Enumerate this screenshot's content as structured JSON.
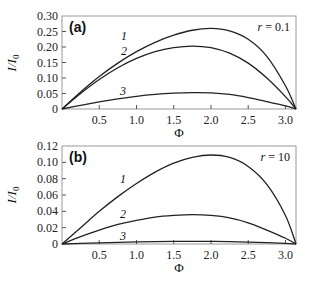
{
  "chart_data": [
    {
      "type": "line",
      "panel_label": "(a)",
      "annotation": "r = 0.1",
      "xlabel": "Φ",
      "ylabel": "I/I0",
      "xlim": [
        0,
        3.14159
      ],
      "ylim": [
        0,
        0.3
      ],
      "xticks": [
        "0.5",
        "1.0",
        "1.5",
        "2.0",
        "2.5",
        "3.0"
      ],
      "yticks": [
        "0",
        "0.05",
        "0.10",
        "0.15",
        "0.20",
        "0.25",
        "0.30"
      ],
      "x": [
        0,
        0.25,
        0.5,
        0.75,
        1.0,
        1.25,
        1.5,
        1.75,
        2.0,
        2.25,
        2.5,
        2.75,
        3.0,
        3.14159
      ],
      "series": [
        {
          "name": "1",
          "values": [
            0,
            0.055,
            0.105,
            0.148,
            0.185,
            0.215,
            0.238,
            0.254,
            0.26,
            0.252,
            0.225,
            0.17,
            0.075,
            0
          ]
        },
        {
          "name": "2",
          "values": [
            0,
            0.05,
            0.095,
            0.133,
            0.163,
            0.185,
            0.198,
            0.203,
            0.198,
            0.18,
            0.148,
            0.1,
            0.04,
            0
          ]
        },
        {
          "name": "3",
          "values": [
            0,
            0.012,
            0.023,
            0.033,
            0.041,
            0.047,
            0.051,
            0.053,
            0.052,
            0.047,
            0.037,
            0.024,
            0.01,
            0
          ]
        }
      ],
      "grid": false
    },
    {
      "type": "line",
      "panel_label": "(b)",
      "annotation": "r = 10",
      "xlabel": "Φ",
      "ylabel": "I/I0",
      "xlim": [
        0,
        3.14159
      ],
      "ylim": [
        0,
        0.12
      ],
      "xticks": [
        "0.5",
        "1.0",
        "1.5",
        "2.0",
        "2.5",
        "3.0"
      ],
      "yticks": [
        "0",
        "0.02",
        "0.04",
        "0.06",
        "0.08",
        "0.10",
        "0.12"
      ],
      "x": [
        0,
        0.25,
        0.5,
        0.75,
        1.0,
        1.25,
        1.5,
        1.75,
        2.0,
        2.25,
        2.5,
        2.75,
        3.0,
        3.14159
      ],
      "series": [
        {
          "name": "1",
          "values": [
            0,
            0.02,
            0.04,
            0.058,
            0.074,
            0.088,
            0.099,
            0.106,
            0.109,
            0.106,
            0.095,
            0.073,
            0.035,
            0
          ]
        },
        {
          "name": "2",
          "values": [
            0,
            0.009,
            0.017,
            0.024,
            0.029,
            0.033,
            0.035,
            0.036,
            0.035,
            0.032,
            0.026,
            0.017,
            0.007,
            0
          ]
        },
        {
          "name": "3",
          "values": [
            0,
            0.0008,
            0.0015,
            0.0021,
            0.0026,
            0.003,
            0.0032,
            0.0033,
            0.0032,
            0.003,
            0.0024,
            0.0016,
            0.0007,
            0
          ]
        }
      ],
      "grid": false
    }
  ],
  "panels": [
    {
      "label": "(a)",
      "param": "r = 0.1",
      "ytitle": "I/I",
      "ysub": "0",
      "xtitle": "Φ"
    },
    {
      "label": "(b)",
      "param": "r = 10",
      "ytitle": "I/I",
      "ysub": "0",
      "xtitle": "Φ"
    }
  ]
}
